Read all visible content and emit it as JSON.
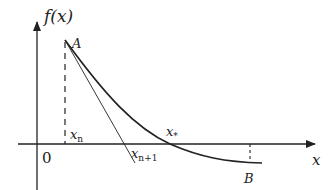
{
  "diagram": {
    "type": "newton-method-illustration",
    "labels": {
      "y_axis": "f(x)",
      "x_axis": "x",
      "origin": "0",
      "point_a": "A",
      "point_b": "B",
      "x_n": "x",
      "x_n_sub": "n",
      "x_n1": "x",
      "x_n1_sub": "n+1",
      "x_star": "x",
      "x_star_sub": "*"
    },
    "colors": {
      "stroke": "#222222",
      "background": "#ffffff"
    }
  }
}
